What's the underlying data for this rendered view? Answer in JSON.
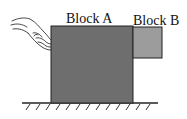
{
  "diagram": {
    "labels": {
      "block_a": "Block A",
      "block_b": "Block B"
    },
    "colors": {
      "block_a": "#6e6e6e",
      "block_b": "#9c9c9c",
      "outline": "#222222"
    }
  }
}
